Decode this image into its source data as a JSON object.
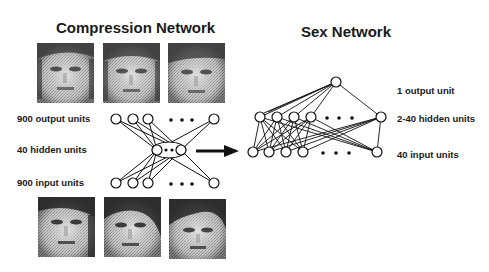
{
  "compression_network": {
    "title": "Compression Network",
    "labels": {
      "output": "900 output units",
      "hidden": "40 hidden units",
      "input": "900 input units"
    },
    "top_faces": [
      "face-1-reconstructed",
      "face-2-reconstructed",
      "face-3-reconstructed"
    ],
    "bottom_faces": [
      "face-1-original",
      "face-2-original",
      "face-3-original"
    ]
  },
  "sex_network": {
    "title": "Sex Network",
    "labels": {
      "output": "1 output unit",
      "hidden": "2-40 hidden units",
      "input": "40 input units"
    }
  },
  "ellipsis": "• • •"
}
